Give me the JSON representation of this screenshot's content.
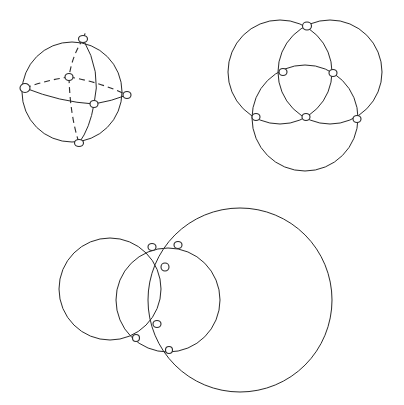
{
  "figures": [
    {
      "id": "sphere-graph",
      "description": "Sphere with three great circles forming an octahedral graph; hidden edges dashed",
      "outline": {
        "cx": 72,
        "cy": 92,
        "r": 50
      },
      "vertices": [
        {
          "x": 83,
          "y": 39,
          "rx": 4.5,
          "ry": 3.5
        },
        {
          "x": 25,
          "y": 88,
          "rx": 5,
          "ry": 4.5
        },
        {
          "x": 69,
          "y": 77,
          "rx": 4,
          "ry": 3.5
        },
        {
          "x": 127,
          "y": 95,
          "rx": 4,
          "ry": 3.5
        },
        {
          "x": 94,
          "y": 104,
          "rx": 4,
          "ry": 3.5
        },
        {
          "x": 79,
          "y": 143,
          "rx": 4.5,
          "ry": 3.5
        }
      ],
      "visible_paths": [
        "M25,88 Q60,102 94,104",
        "M94,104 Q112,101 127,95",
        "M83,39 Q102,72 94,104",
        "M94,104 Q90,128 79,143"
      ],
      "hidden_paths": [
        "M25,88 Q47,80 69,77",
        "M69,77 Q100,82 127,95",
        "M83,39 Q72,56 69,77",
        "M69,77 Q70,115 79,143",
        "M83,39 L86,31"
      ]
    },
    {
      "id": "three-circles-symmetric",
      "description": "Three mutually intersecting circles of equal size",
      "circles": [
        {
          "cx": 280,
          "cy": 72,
          "r": 52
        },
        {
          "cx": 330,
          "cy": 72,
          "r": 52
        },
        {
          "cx": 305,
          "cy": 118,
          "r": 53
        }
      ],
      "vertices": [
        {
          "x": 307,
          "y": 26,
          "rx": 4.5,
          "ry": 4
        },
        {
          "x": 283,
          "y": 72,
          "rx": 4,
          "ry": 3.5
        },
        {
          "x": 333,
          "y": 73,
          "rx": 4,
          "ry": 3.5
        },
        {
          "x": 256,
          "y": 117,
          "rx": 4,
          "ry": 3.5
        },
        {
          "x": 306,
          "y": 117,
          "rx": 4,
          "ry": 3.5
        },
        {
          "x": 357,
          "y": 119,
          "rx": 4,
          "ry": 3.5
        }
      ]
    },
    {
      "id": "three-circles-asymmetric",
      "description": "Three intersecting circles of different sizes with a lens-shaped inner region",
      "circles": [
        {
          "cx": 110,
          "cy": 289,
          "r": 51
        },
        {
          "cx": 168,
          "cy": 300,
          "r": 52
        },
        {
          "cx": 240,
          "cy": 300,
          "r": 92
        }
      ],
      "extra_paths": [
        "M152,247 Q168,258 166,268 Q173,295 156,323 Q145,335 136,338",
        "M166,268 Q152,298 157,323 Q165,340 169,350",
        "M152,247 Q165,244 178,245"
      ],
      "vertices": [
        {
          "x": 152,
          "y": 247,
          "rx": 4,
          "ry": 3.5
        },
        {
          "x": 178,
          "y": 245,
          "rx": 4,
          "ry": 3.5
        },
        {
          "x": 165,
          "y": 267,
          "rx": 4,
          "ry": 4
        },
        {
          "x": 157,
          "y": 324,
          "rx": 4,
          "ry": 3.5
        },
        {
          "x": 136,
          "y": 338,
          "rx": 3.5,
          "ry": 3.5
        },
        {
          "x": 169,
          "y": 350,
          "rx": 3.5,
          "ry": 3.5
        }
      ]
    }
  ],
  "colors": {
    "stroke": "#2a2a2a",
    "background": "#ffffff"
  }
}
